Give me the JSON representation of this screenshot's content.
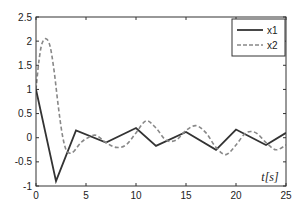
{
  "chart_data": {
    "type": "line",
    "title": "",
    "xlabel": "t[s]",
    "ylabel": "",
    "xlim": [
      0,
      25
    ],
    "ylim": [
      -1,
      2.5
    ],
    "xticks": [
      0,
      5,
      10,
      15,
      20,
      25
    ],
    "yticks": [
      -1,
      -0.5,
      0,
      0.5,
      1,
      1.5,
      2,
      2.5
    ],
    "xtick_labels": [
      "0",
      "5",
      "10",
      "15",
      "20",
      "25"
    ],
    "ytick_labels": [
      "-1",
      "-0.5",
      "0",
      "0.5",
      "1",
      "1.5",
      "2",
      "2.5"
    ],
    "grid": false,
    "legend_position": "upper right",
    "series": [
      {
        "name": "x1",
        "style": "solid",
        "color": "#333333",
        "x": [
          0,
          2,
          4,
          7,
          10,
          12,
          15,
          18,
          20,
          23,
          25
        ],
        "y": [
          1.0,
          -0.9,
          0.15,
          -0.1,
          0.2,
          -0.17,
          0.12,
          -0.25,
          0.17,
          -0.15,
          0.1
        ]
      },
      {
        "name": "x2",
        "style": "dashed",
        "color": "#888888",
        "x": [
          0,
          0.3,
          0.6,
          1.0,
          1.4,
          1.8,
          2.2,
          2.6,
          3.0,
          3.4,
          3.8,
          4.5,
          5.2,
          6.0,
          7.0,
          8.0,
          9.0,
          10.0,
          11.0,
          12.0,
          13.0,
          14.0,
          15.0,
          16.0,
          17.0,
          18.0,
          19.0,
          20.0,
          21.0,
          22.0,
          23.0,
          24.0,
          25.0
        ],
        "y": [
          1.0,
          1.6,
          1.95,
          2.05,
          1.9,
          1.4,
          0.7,
          0.1,
          -0.25,
          -0.32,
          -0.28,
          -0.1,
          0.0,
          0.05,
          -0.1,
          -0.2,
          -0.15,
          0.1,
          0.35,
          0.2,
          -0.05,
          -0.05,
          0.15,
          0.25,
          0.1,
          -0.2,
          -0.35,
          -0.15,
          0.1,
          0.1,
          -0.1,
          -0.25,
          -0.15
        ]
      }
    ]
  }
}
